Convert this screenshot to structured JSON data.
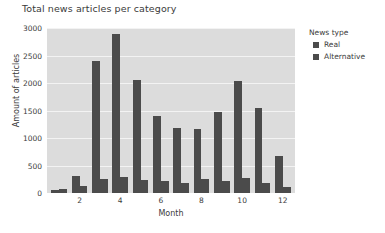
{
  "chart_data": {
    "type": "bar",
    "title": "Total news articles per category",
    "xlabel": "Month",
    "ylabel": "Amount of articles",
    "categories": [
      1,
      2,
      3,
      4,
      5,
      6,
      7,
      8,
      9,
      10,
      11,
      12
    ],
    "xtick_labels": [
      "2",
      "4",
      "6",
      "8",
      "10",
      "12"
    ],
    "xtick_positions": [
      2,
      4,
      6,
      8,
      10,
      12
    ],
    "ytick_labels": [
      "0",
      "500",
      "1000",
      "1500",
      "2000",
      "2500",
      "3000"
    ],
    "ylim": [
      0,
      3000
    ],
    "xlim": [
      0.4,
      12.6
    ],
    "grid": "horizontal",
    "legend_position": "right",
    "legend_title": "News type",
    "series": [
      {
        "name": "Real",
        "color": "#4b4b4b",
        "values": [
          60,
          310,
          2400,
          2900,
          2050,
          1400,
          1180,
          1165,
          1480,
          2045,
          1545,
          680
        ]
      },
      {
        "name": "Alternative",
        "color": "#4b4b4b",
        "values": [
          65,
          120,
          255,
          290,
          245,
          225,
          190,
          255,
          215,
          275,
          185,
          110
        ]
      }
    ]
  },
  "legend": {
    "title": "News type",
    "items": [
      {
        "label": "Real",
        "color": "#4b4b4b"
      },
      {
        "label": "Alternative",
        "color": "#4b4b4b"
      }
    ]
  },
  "colors": {
    "plot_background": "#dcdcdc",
    "figure_background": "#ffffff",
    "gridline": "#f3f3f3",
    "bar": "#4b4b4b",
    "text": "#3c3c3c"
  }
}
